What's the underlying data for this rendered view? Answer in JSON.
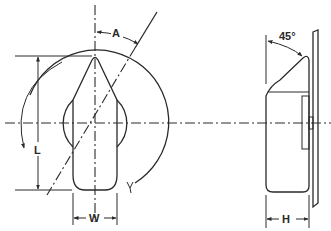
{
  "diagram": {
    "front_view": {
      "labels": {
        "angle": "A",
        "length": "L",
        "width": "W"
      }
    },
    "side_view": {
      "labels": {
        "angle": "45°",
        "height": "H"
      }
    },
    "colors": {
      "line": "#2a2a2a",
      "background": "#ffffff"
    }
  }
}
